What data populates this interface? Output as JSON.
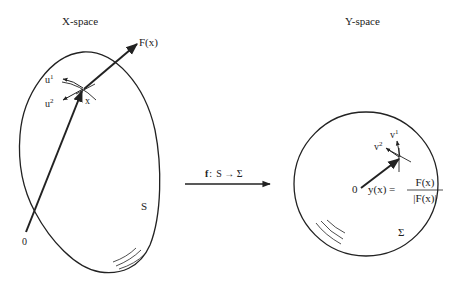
{
  "x_space": {
    "title": "X-space",
    "set_label": "S",
    "origin_label": "0",
    "point_label": "x",
    "vector_label": "F(x)",
    "basis": [
      {
        "base": "u",
        "index": "1"
      },
      {
        "base": "u",
        "index": "2"
      }
    ]
  },
  "mapping": {
    "func": "f",
    "sep": ":",
    "text": "S → Σ"
  },
  "y_space": {
    "title": "Y-space",
    "set_label": "Σ",
    "origin_label": "0",
    "basis": [
      {
        "base": "v",
        "index": "1"
      },
      {
        "base": "v",
        "index": "2"
      }
    ],
    "formula": {
      "lhs": "y(x) =",
      "numerator": "F(x)",
      "denominator": "|F(x)|"
    }
  },
  "colors": {
    "ink": "#222222",
    "background": "#ffffff"
  }
}
